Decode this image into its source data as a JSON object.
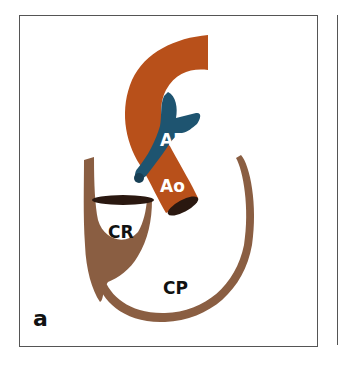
{
  "figure": {
    "panel_label": "a",
    "labels": {
      "ap": "AP",
      "ao": "Ao",
      "cr": "CR",
      "cp": "CP"
    },
    "colors": {
      "aorta": "#b8501a",
      "pulmonary_artery": "#1e5470",
      "heart_chambers": "#8a5e42",
      "opening": "#2a1810",
      "label_light": "#ffffff",
      "label_dark": "#111111",
      "frame": "#555555"
    }
  }
}
